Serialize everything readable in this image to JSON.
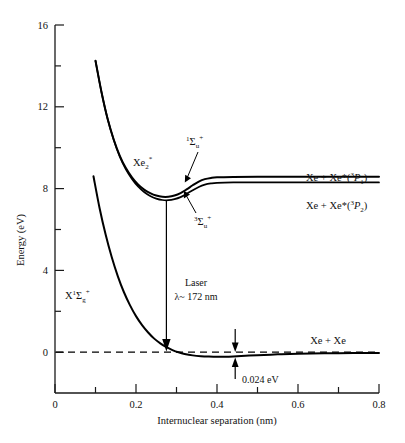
{
  "figure": {
    "kind": "potential-energy-curves",
    "background_color": "#ffffff",
    "line_color": "#000000"
  },
  "axes": {
    "x": {
      "label": "Internuclear separation (nm)",
      "min": 0,
      "max": 0.8,
      "major_ticks": [
        "0",
        "0.2",
        "0.4",
        "0.6",
        "0.8"
      ],
      "major_tick_values": [
        0,
        0.2,
        0.4,
        0.6,
        0.8
      ],
      "minor_tick_values": [
        0.1,
        0.3,
        0.5,
        0.7
      ]
    },
    "y": {
      "label": "Energy (eV)",
      "min": -2,
      "max": 16,
      "major_ticks": [
        "0",
        "4",
        "8",
        "12",
        "16"
      ],
      "major_tick_values": [
        0,
        4,
        8,
        12,
        16
      ],
      "minor_tick_values": [
        2,
        6,
        10,
        14
      ]
    }
  },
  "labels": {
    "excited_state": {
      "base": "Xe",
      "sub": "2",
      "sup": "*"
    },
    "singlet_sigma_u": {
      "pre_sup": "1",
      "sigma": "Σ",
      "sub": "u",
      "post_sup": "+"
    },
    "triplet_sigma_u": {
      "pre_sup": "3",
      "sigma": "Σ",
      "sub": "u",
      "post_sup": "+"
    },
    "ground_state": {
      "x": "X",
      "pre_sup": "1",
      "sigma": "Σ",
      "sub": "g",
      "post_sup": "+"
    },
    "asymptote_upper": {
      "pre": "Xe + Xe*(",
      "sup": "3",
      "term": "P",
      "sub": "1",
      "post": ")"
    },
    "asymptote_lower": {
      "pre": "Xe + Xe*(",
      "sup": "3",
      "term": "P",
      "sub": "2",
      "post": ")"
    },
    "ground_asymptote": "Xe + Xe",
    "laser_title": "Laser",
    "laser_wavelength": "λ~ 172 nm",
    "well_depth": "0.024 eV"
  },
  "chart_data": {
    "type": "line",
    "title": "",
    "xlabel": "Internuclear separation (nm)",
    "ylabel": "Energy (eV)",
    "xlim": [
      0,
      0.8
    ],
    "ylim": [
      -2,
      16
    ],
    "grid": false,
    "legend": "none",
    "series": [
      {
        "name": "Xe2* 1Sigma_u+",
        "points": [
          [
            0.1,
            14.25
          ],
          [
            0.115,
            12.7
          ],
          [
            0.13,
            11.4
          ],
          [
            0.145,
            10.4
          ],
          [
            0.16,
            9.6
          ],
          [
            0.175,
            9.0
          ],
          [
            0.19,
            8.55
          ],
          [
            0.205,
            8.2
          ],
          [
            0.22,
            7.95
          ],
          [
            0.235,
            7.78
          ],
          [
            0.25,
            7.66
          ],
          [
            0.265,
            7.6
          ],
          [
            0.28,
            7.6
          ],
          [
            0.295,
            7.66
          ],
          [
            0.31,
            7.78
          ],
          [
            0.325,
            7.96
          ],
          [
            0.34,
            8.16
          ],
          [
            0.355,
            8.34
          ],
          [
            0.37,
            8.46
          ],
          [
            0.385,
            8.52
          ],
          [
            0.4,
            8.55
          ],
          [
            0.44,
            8.57
          ],
          [
            0.5,
            8.58
          ],
          [
            0.6,
            8.58
          ],
          [
            0.7,
            8.58
          ],
          [
            0.8,
            8.58
          ]
        ]
      },
      {
        "name": "Xe2* 3Sigma_u+",
        "points": [
          [
            0.1,
            14.25
          ],
          [
            0.115,
            12.7
          ],
          [
            0.13,
            11.4
          ],
          [
            0.145,
            10.38
          ],
          [
            0.16,
            9.56
          ],
          [
            0.175,
            8.94
          ],
          [
            0.19,
            8.47
          ],
          [
            0.205,
            8.1
          ],
          [
            0.22,
            7.83
          ],
          [
            0.235,
            7.64
          ],
          [
            0.25,
            7.51
          ],
          [
            0.265,
            7.44
          ],
          [
            0.28,
            7.43
          ],
          [
            0.295,
            7.48
          ],
          [
            0.31,
            7.58
          ],
          [
            0.325,
            7.74
          ],
          [
            0.34,
            7.92
          ],
          [
            0.355,
            8.08
          ],
          [
            0.37,
            8.19
          ],
          [
            0.385,
            8.25
          ],
          [
            0.4,
            8.28
          ],
          [
            0.44,
            8.3
          ],
          [
            0.5,
            8.3
          ],
          [
            0.6,
            8.3
          ],
          [
            0.7,
            8.3
          ],
          [
            0.8,
            8.3
          ]
        ]
      },
      {
        "name": "X 1Sigma_g+ ground state",
        "points": [
          [
            0.095,
            8.6
          ],
          [
            0.11,
            7.05
          ],
          [
            0.125,
            5.75
          ],
          [
            0.14,
            4.65
          ],
          [
            0.155,
            3.72
          ],
          [
            0.17,
            2.94
          ],
          [
            0.185,
            2.3
          ],
          [
            0.2,
            1.76
          ],
          [
            0.215,
            1.32
          ],
          [
            0.23,
            0.96
          ],
          [
            0.245,
            0.66
          ],
          [
            0.26,
            0.43
          ],
          [
            0.275,
            0.24
          ],
          [
            0.29,
            0.1
          ],
          [
            0.305,
            -0.01
          ],
          [
            0.32,
            -0.09
          ],
          [
            0.34,
            -0.16
          ],
          [
            0.36,
            -0.2
          ],
          [
            0.38,
            -0.22
          ],
          [
            0.4,
            -0.23
          ],
          [
            0.42,
            -0.225
          ],
          [
            0.44,
            -0.21
          ],
          [
            0.47,
            -0.18
          ],
          [
            0.5,
            -0.15
          ],
          [
            0.55,
            -0.11
          ],
          [
            0.6,
            -0.08
          ],
          [
            0.7,
            -0.05
          ],
          [
            0.8,
            -0.04
          ]
        ]
      }
    ],
    "reference_lines": [
      {
        "name": "zero-energy-dashed",
        "y": 0,
        "x_start": 0.0,
        "x_end": 0.8,
        "style": "dashed"
      }
    ],
    "annotations": [
      {
        "name": "laser-transition-arrow",
        "text": "Laser λ~ 172 nm",
        "x": 0.275,
        "y_from": 7.45,
        "y_to": 0.15,
        "direction": "down"
      },
      {
        "name": "well-depth-marker",
        "text": "0.024 eV",
        "x": 0.445,
        "y_from": 0.55,
        "y_to": -0.23,
        "value": 0.024,
        "unit": "eV"
      }
    ]
  }
}
